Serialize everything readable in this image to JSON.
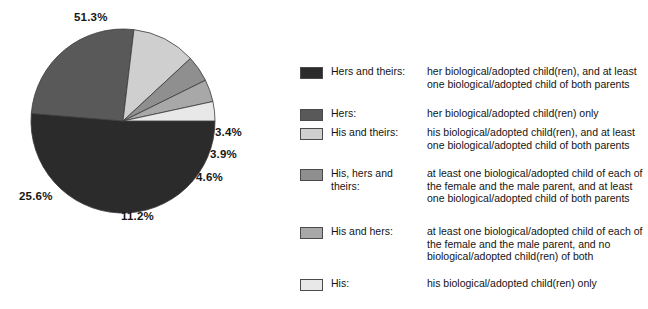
{
  "chart_data": {
    "type": "pie",
    "title": "",
    "categories": [
      "Hers and theirs",
      "Hers",
      "His and theirs",
      "His, hers and theirs",
      "His and hers",
      "His"
    ],
    "values": [
      51.3,
      25.6,
      11.2,
      4.6,
      3.9,
      3.4
    ],
    "value_labels": [
      "51.3%",
      "25.6%",
      "11.2%",
      "4.6%",
      "3.9%",
      "3.4%"
    ],
    "unit": "%",
    "colors": [
      "#2b2b2b",
      "#595959",
      "#cfcfcf",
      "#8f8f8f",
      "#a8a8a8",
      "#e8e8e8"
    ],
    "legend_position": "right",
    "grid": false,
    "start_angle_deg": 0,
    "direction": "clockwise"
  },
  "pie": {
    "labels": {
      "hers_and_theirs": "51.3%",
      "hers": "25.6%",
      "his_and_theirs": "11.2%",
      "his_hers_and_theirs": "4.6%",
      "his_and_hers": "3.9%",
      "his": "3.4%"
    }
  },
  "legend": {
    "items": [
      {
        "key": "hers-and-theirs",
        "name": "Hers and theirs:",
        "description": "her biological/adopted child(ren), and at least one biological/adopted child of both parents",
        "color": "#2b2b2b"
      },
      {
        "key": "hers",
        "name": "Hers:",
        "description": "her biological/adopted child(ren) only",
        "color": "#595959"
      },
      {
        "key": "his-and-theirs",
        "name": "His and theirs:",
        "description": "his biological/adopted child(ren), and at least one biological/adopted child of both parents",
        "color": "#cfcfcf"
      },
      {
        "key": "his-hers-and-theirs",
        "name": "His, hers and theirs:",
        "description": "at least one biological/adopted child of each of the female and the male parent, and at least one biological/adopted child of both parents",
        "color": "#8f8f8f"
      },
      {
        "key": "his-and-hers",
        "name": "His and hers:",
        "description": "at least one biological/adopted child of each of the female and the male parent, and no biological/adopted child(ren) of both",
        "color": "#a8a8a8"
      },
      {
        "key": "his",
        "name": "His:",
        "description": "his biological/adopted child(ren) only",
        "color": "#e8e8e8"
      }
    ]
  }
}
